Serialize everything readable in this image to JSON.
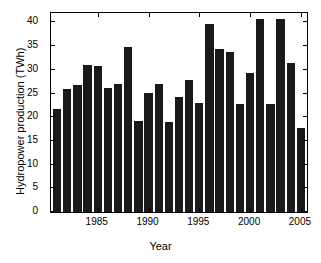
{
  "chart_data": {
    "type": "bar",
    "title": "",
    "xlabel": "Year",
    "ylabel": "Hydropower production (TWh)",
    "categories": [
      1981,
      1982,
      1983,
      1984,
      1985,
      1986,
      1987,
      1988,
      1989,
      1990,
      1991,
      1992,
      1993,
      1994,
      1995,
      1996,
      1997,
      1998,
      1999,
      2000,
      2001,
      2002,
      2003,
      2004,
      2005
    ],
    "values": [
      21.8,
      26.0,
      26.8,
      31.1,
      30.9,
      26.1,
      27.1,
      34.8,
      19.3,
      25.2,
      27.1,
      18.9,
      24.2,
      27.9,
      23.0,
      39.6,
      34.5,
      33.8,
      22.8,
      29.4,
      40.8,
      22.9,
      40.8,
      31.4,
      17.8
    ],
    "xlim": [
      1980.4,
      2005.6
    ],
    "ylim": [
      0,
      42
    ],
    "ytick_values": [
      0,
      5,
      10,
      15,
      20,
      25,
      30,
      35,
      40
    ],
    "ytick_labels": [
      "0",
      "5",
      "10",
      "15",
      "20",
      "25",
      "30",
      "35",
      "40"
    ],
    "xtick_values": [
      1985,
      1990,
      1995,
      2000,
      2005
    ],
    "xtick_labels": [
      "1985",
      "1990",
      "1995",
      "2000",
      "2005"
    ],
    "grid": false,
    "legend": null,
    "bar_color": "#1a1a1a",
    "axis_color": "#000000",
    "background_color": "#ffffff"
  }
}
